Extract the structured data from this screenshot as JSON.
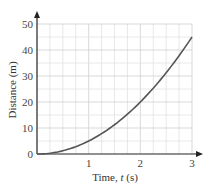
{
  "chart_data": {
    "type": "line",
    "title": "",
    "xlabel": "Time, t (s)",
    "xlabel_parts": {
      "prefix": "Time, ",
      "var": "t",
      "suffix": " (s)"
    },
    "ylabel": "Distance (m)",
    "xlim": [
      0,
      3
    ],
    "ylim": [
      0,
      50
    ],
    "x_ticks": [
      1,
      2,
      3
    ],
    "y_ticks": [
      0,
      10,
      20,
      30,
      40,
      50
    ],
    "x_grid_step": 0.25,
    "y_grid_step": 5,
    "grid": true,
    "legend": null,
    "series": [
      {
        "name": "distance",
        "equation": "d = 5t^2",
        "color": "#555555",
        "x": [
          0,
          0.25,
          0.5,
          0.75,
          1,
          1.25,
          1.5,
          1.75,
          2,
          2.25,
          2.5,
          2.75,
          3
        ],
        "values": [
          0,
          0.31,
          1.25,
          2.81,
          5,
          7.81,
          11.25,
          15.31,
          20,
          25.31,
          31.25,
          37.81,
          45
        ]
      }
    ]
  },
  "colors": {
    "grid_minor": "#e2e2e2",
    "grid_major": "#cfcfcf",
    "axis": "#222222",
    "curve": "#555555"
  }
}
